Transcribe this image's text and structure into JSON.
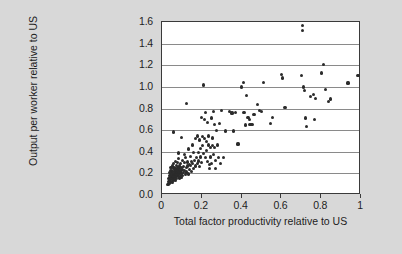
{
  "chart_data": {
    "type": "scatter",
    "title": "",
    "xlabel": "Total factor productivity relative to US",
    "ylabel": "Output per worker relative to US",
    "xlim": [
      0,
      1
    ],
    "ylim": [
      0,
      1.6
    ],
    "xticks": [
      0,
      0.2,
      0.4,
      0.6,
      0.8,
      1
    ],
    "xticklabels": [
      "0",
      "0.2",
      "0.4",
      "0.6",
      "0.8",
      "1"
    ],
    "yticks": [
      0.0,
      0.2,
      0.4,
      0.6,
      0.8,
      1.0,
      1.2,
      1.4,
      1.6
    ],
    "yticklabels": [
      "0.0",
      "0.2",
      "0.4",
      "0.6",
      "0.8",
      "1.0",
      "1.2",
      "1.4",
      "1.6"
    ],
    "grid": "horizontal",
    "grid_color": "#8a8a8a",
    "legend": "none",
    "marker_color": "#2b2b2b",
    "plot_background": "#ffffff",
    "figure_background": "#d8d8d8",
    "series": [
      {
        "name": "countries",
        "points": [
          [
            0.03,
            0.1
          ],
          [
            0.032,
            0.125
          ],
          [
            0.034,
            0.15
          ],
          [
            0.035,
            0.108
          ],
          [
            0.036,
            0.178
          ],
          [
            0.038,
            0.205
          ],
          [
            0.039,
            0.132
          ],
          [
            0.04,
            0.16
          ],
          [
            0.041,
            0.225
          ],
          [
            0.042,
            0.118
          ],
          [
            0.043,
            0.19
          ],
          [
            0.044,
            0.142
          ],
          [
            0.045,
            0.252
          ],
          [
            0.046,
            0.168
          ],
          [
            0.047,
            0.205
          ],
          [
            0.048,
            0.128
          ],
          [
            0.049,
            0.23
          ],
          [
            0.05,
            0.155
          ],
          [
            0.051,
            0.185
          ],
          [
            0.052,
            0.268
          ],
          [
            0.053,
            0.112
          ],
          [
            0.054,
            0.215
          ],
          [
            0.055,
            0.172
          ],
          [
            0.056,
            0.245
          ],
          [
            0.057,
            0.138
          ],
          [
            0.058,
            0.198
          ],
          [
            0.059,
            0.29
          ],
          [
            0.06,
            0.162
          ],
          [
            0.061,
            0.222
          ],
          [
            0.062,
            0.148
          ],
          [
            0.063,
            0.188
          ],
          [
            0.064,
            0.258
          ],
          [
            0.065,
            0.175
          ],
          [
            0.066,
            0.312
          ],
          [
            0.067,
            0.205
          ],
          [
            0.068,
            0.135
          ],
          [
            0.069,
            0.24
          ],
          [
            0.07,
            0.192
          ],
          [
            0.071,
            0.168
          ],
          [
            0.072,
            0.275
          ],
          [
            0.073,
            0.215
          ],
          [
            0.074,
            0.15
          ],
          [
            0.075,
            0.232
          ],
          [
            0.076,
            0.185
          ],
          [
            0.078,
            0.3
          ],
          [
            0.079,
            0.205
          ],
          [
            0.08,
            0.258
          ],
          [
            0.081,
            0.172
          ],
          [
            0.082,
            0.338
          ],
          [
            0.083,
            0.222
          ],
          [
            0.084,
            0.195
          ],
          [
            0.086,
            0.268
          ],
          [
            0.088,
            0.158
          ],
          [
            0.089,
            0.242
          ],
          [
            0.09,
            0.212
          ],
          [
            0.092,
            0.182
          ],
          [
            0.094,
            0.288
          ],
          [
            0.095,
            0.225
          ],
          [
            0.096,
            0.165
          ],
          [
            0.098,
            0.255
          ],
          [
            0.1,
            0.198
          ],
          [
            0.102,
            0.318
          ],
          [
            0.104,
            0.235
          ],
          [
            0.105,
            0.178
          ],
          [
            0.058,
            0.582
          ],
          [
            0.108,
            0.262
          ],
          [
            0.11,
            0.205
          ],
          [
            0.112,
            0.372
          ],
          [
            0.114,
            0.298
          ],
          [
            0.115,
            0.228
          ],
          [
            0.118,
            0.188
          ],
          [
            0.12,
            0.345
          ],
          [
            0.122,
            0.255
          ],
          [
            0.082,
            0.388
          ],
          [
            0.125,
            0.212
          ],
          [
            0.128,
            0.305
          ],
          [
            0.098,
            0.53
          ],
          [
            0.13,
            0.268
          ],
          [
            0.132,
            0.195
          ],
          [
            0.135,
            0.425
          ],
          [
            0.138,
            0.285
          ],
          [
            0.125,
            0.845
          ],
          [
            0.14,
            0.238
          ],
          [
            0.142,
            0.355
          ],
          [
            0.145,
            0.272
          ],
          [
            0.148,
            0.308
          ],
          [
            0.15,
            0.218
          ],
          [
            0.152,
            0.462
          ],
          [
            0.155,
            0.292
          ],
          [
            0.158,
            0.245
          ],
          [
            0.16,
            0.392
          ],
          [
            0.165,
            0.318
          ],
          [
            0.168,
            0.268
          ],
          [
            0.17,
            0.52
          ],
          [
            0.175,
            0.345
          ],
          [
            0.178,
            0.288
          ],
          [
            0.18,
            0.545
          ],
          [
            0.182,
            0.392
          ],
          [
            0.185,
            0.315
          ],
          [
            0.188,
            0.262
          ],
          [
            0.19,
            0.508
          ],
          [
            0.192,
            0.43
          ],
          [
            0.195,
            0.352
          ],
          [
            0.198,
            0.298
          ],
          [
            0.2,
            0.718
          ],
          [
            0.202,
            0.538
          ],
          [
            0.205,
            0.455
          ],
          [
            0.208,
            0.382
          ],
          [
            0.21,
            1.018
          ],
          [
            0.212,
            0.695
          ],
          [
            0.215,
            0.522
          ],
          [
            0.218,
            0.348
          ],
          [
            0.22,
            0.765
          ],
          [
            0.222,
            0.495
          ],
          [
            0.225,
            0.408
          ],
          [
            0.228,
            0.312
          ],
          [
            0.23,
            0.672
          ],
          [
            0.232,
            0.545
          ],
          [
            0.235,
            0.462
          ],
          [
            0.238,
            0.285
          ],
          [
            0.24,
            0.248
          ],
          [
            0.242,
            0.438
          ],
          [
            0.245,
            0.352
          ],
          [
            0.248,
            0.292
          ],
          [
            0.25,
            0.712
          ],
          [
            0.252,
            0.528
          ],
          [
            0.255,
            0.455
          ],
          [
            0.258,
            0.378
          ],
          [
            0.26,
            0.775
          ],
          [
            0.262,
            0.652
          ],
          [
            0.265,
            0.438
          ],
          [
            0.268,
            0.322
          ],
          [
            0.27,
            0.245
          ],
          [
            0.275,
            0.598
          ],
          [
            0.28,
            0.462
          ],
          [
            0.285,
            0.348
          ],
          [
            0.29,
            0.662
          ],
          [
            0.295,
            0.292
          ],
          [
            0.3,
            0.778
          ],
          [
            0.31,
            0.348
          ],
          [
            0.32,
            0.592
          ],
          [
            0.34,
            0.772
          ],
          [
            0.352,
            0.758
          ],
          [
            0.36,
            0.592
          ],
          [
            0.368,
            0.765
          ],
          [
            0.382,
            0.472
          ],
          [
            0.4,
            0.998
          ],
          [
            0.408,
            1.042
          ],
          [
            0.412,
            0.762
          ],
          [
            0.418,
            0.648
          ],
          [
            0.425,
            0.918
          ],
          [
            0.432,
            0.718
          ],
          [
            0.438,
            0.695
          ],
          [
            0.442,
            0.652
          ],
          [
            0.452,
            0.655
          ],
          [
            0.462,
            0.742
          ],
          [
            0.478,
            0.838
          ],
          [
            0.488,
            0.782
          ],
          [
            0.5,
            0.772
          ],
          [
            0.512,
            1.038
          ],
          [
            0.545,
            0.658
          ],
          [
            0.555,
            0.718
          ],
          [
            0.6,
            1.118
          ],
          [
            0.605,
            1.082
          ],
          [
            0.618,
            0.812
          ],
          [
            0.7,
            1.108
          ],
          [
            0.705,
            1.568
          ],
          [
            0.708,
            1.522
          ],
          [
            0.712,
            0.998
          ],
          [
            0.718,
            0.968
          ],
          [
            0.722,
            0.712
          ],
          [
            0.728,
            0.632
          ],
          [
            0.745,
            0.912
          ],
          [
            0.762,
            0.932
          ],
          [
            0.768,
            0.702
          ],
          [
            0.772,
            0.895
          ],
          [
            0.8,
            1.128
          ],
          [
            0.812,
            1.208
          ],
          [
            0.822,
            0.978
          ],
          [
            0.835,
            0.862
          ],
          [
            0.845,
            0.888
          ],
          [
            0.935,
            1.035
          ],
          [
            0.985,
            1.102
          ]
        ]
      }
    ]
  }
}
